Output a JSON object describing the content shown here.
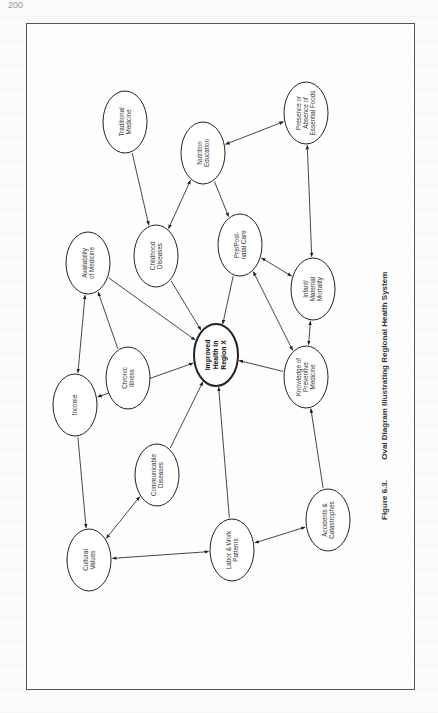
{
  "page": {
    "page_number": "200"
  },
  "figure": {
    "number": "Figure 6.3.",
    "title": "Oval Diagram Illustrating Regional Health System"
  },
  "nodes": [
    {
      "id": "traditional",
      "lines": [
        "Traditional",
        "Medicine"
      ],
      "cx": 125,
      "cy": 122
    },
    {
      "id": "nutrition",
      "lines": [
        "Nutrition",
        "Education"
      ],
      "cx": 203,
      "cy": 153
    },
    {
      "id": "presence",
      "lines": [
        "Presence or",
        "Absence of",
        "Essential Foods"
      ],
      "cx": 306,
      "cy": 113
    },
    {
      "id": "childhood",
      "lines": [
        "Childhood",
        "Diseases"
      ],
      "cx": 156,
      "cy": 256
    },
    {
      "id": "prepost",
      "lines": [
        "Pre/Post-",
        "natal Care"
      ],
      "cx": 240,
      "cy": 245
    },
    {
      "id": "infant",
      "lines": [
        "Infant/",
        "Maternal",
        "Mortality"
      ],
      "cx": 313,
      "cy": 289
    },
    {
      "id": "availability",
      "lines": [
        "Availability",
        "of Medicine"
      ],
      "cx": 88,
      "cy": 263
    },
    {
      "id": "chronic",
      "lines": [
        "Chronic",
        "Illness"
      ],
      "cx": 128,
      "cy": 378
    },
    {
      "id": "improved",
      "lines": [
        "Improved",
        "Health in",
        "Region X"
      ],
      "cx": 216,
      "cy": 355,
      "bold": true
    },
    {
      "id": "knowledge",
      "lines": [
        "Knowledge of",
        "Preventive",
        "Medicine"
      ],
      "cx": 306,
      "cy": 377
    },
    {
      "id": "income",
      "lines": [
        "Income"
      ],
      "cx": 75,
      "cy": 405
    },
    {
      "id": "communicable",
      "lines": [
        "Communicable",
        "Diseases"
      ],
      "cx": 157,
      "cy": 475
    },
    {
      "id": "cultural",
      "lines": [
        "Cultural",
        "Values"
      ],
      "cx": 89,
      "cy": 560
    },
    {
      "id": "labor",
      "lines": [
        "Labor & Work",
        "Patterns"
      ],
      "cx": 232,
      "cy": 550
    },
    {
      "id": "accidents",
      "lines": [
        "Accidents &",
        "Catastrophes"
      ],
      "cx": 328,
      "cy": 520
    }
  ],
  "edges": [
    {
      "from": "traditional",
      "to": "childhood",
      "bidirectional": false
    },
    {
      "from": "nutrition",
      "to": "childhood",
      "bidirectional": true
    },
    {
      "from": "nutrition",
      "to": "prepost",
      "bidirectional": false
    },
    {
      "from": "nutrition",
      "to": "presence",
      "bidirectional": true
    },
    {
      "from": "presence",
      "to": "infant",
      "bidirectional": true
    },
    {
      "from": "prepost",
      "to": "infant",
      "bidirectional": true
    },
    {
      "from": "childhood",
      "to": "improved",
      "bidirectional": false
    },
    {
      "from": "prepost",
      "to": "improved",
      "bidirectional": false
    },
    {
      "from": "availability",
      "to": "improved",
      "bidirectional": false
    },
    {
      "from": "knowledge",
      "to": "improved",
      "bidirectional": false
    },
    {
      "from": "knowledge",
      "to": "prepost",
      "bidirectional": true
    },
    {
      "from": "knowledge",
      "to": "infant",
      "bidirectional": true
    },
    {
      "from": "chronic",
      "to": "availability",
      "bidirectional": false
    },
    {
      "from": "income",
      "to": "availability",
      "bidirectional": true
    },
    {
      "from": "income",
      "to": "improved",
      "bidirectional": true
    },
    {
      "from": "income",
      "to": "cultural",
      "bidirectional": false
    },
    {
      "from": "communicable",
      "to": "improved",
      "bidirectional": false
    },
    {
      "from": "communicable",
      "to": "cultural",
      "bidirectional": true
    },
    {
      "from": "labor",
      "to": "improved",
      "bidirectional": false
    },
    {
      "from": "cultural",
      "to": "labor",
      "bidirectional": true
    },
    {
      "from": "labor",
      "to": "accidents",
      "bidirectional": true
    },
    {
      "from": "accidents",
      "to": "knowledge",
      "bidirectional": false
    }
  ],
  "style": {
    "line_color": "#333333",
    "node_stroke": "#222222",
    "node_fill": "#ffffff"
  }
}
